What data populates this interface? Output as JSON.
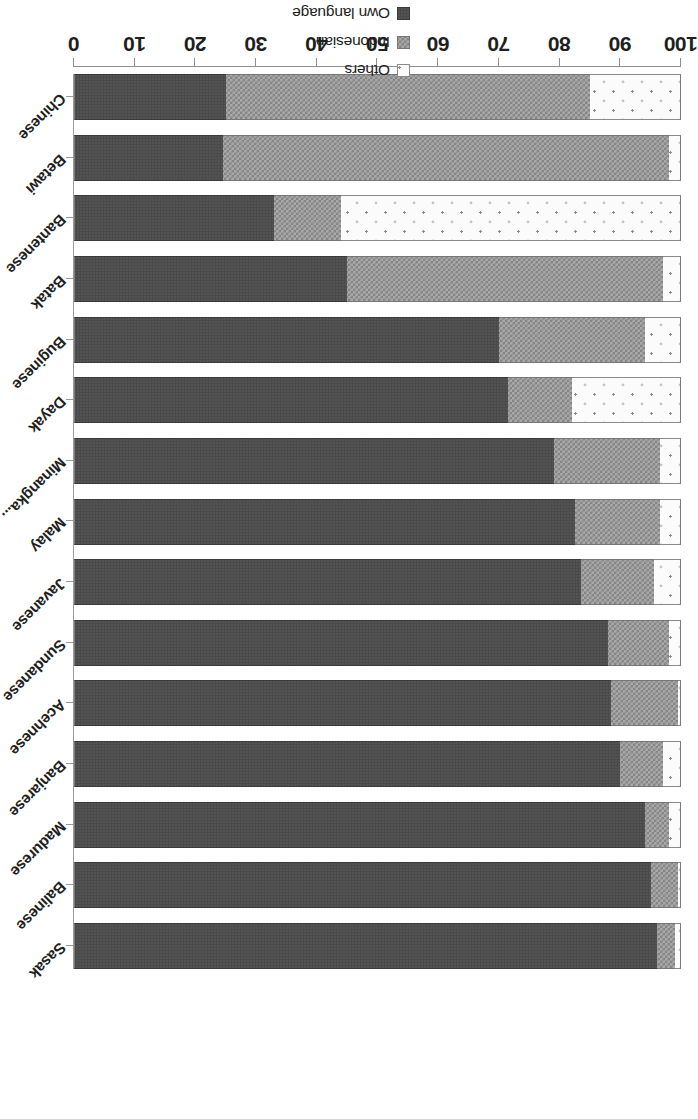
{
  "chart_data": {
    "type": "bar",
    "orientation": "horizontal",
    "stacked": true,
    "stack_mode": "percent",
    "title": "",
    "subtitle": "",
    "xlabel": "",
    "ylabel": "",
    "xlim": [
      0,
      100
    ],
    "xticks": [
      0,
      10,
      20,
      30,
      40,
      50,
      60,
      70,
      80,
      90,
      100
    ],
    "xticklabels": [
      "0",
      "10",
      "20",
      "30",
      "40",
      "50",
      "60",
      "70",
      "80",
      "90",
      "100"
    ],
    "grid": false,
    "legend_position": "bottom-center",
    "legend_order_displayed": [
      "Others",
      "Indonesian",
      "Own language"
    ],
    "categories": [
      "Sasak",
      "Balinese",
      "Madurese",
      "Banjarese",
      "Acehnese",
      "Sundanese",
      "Javanese",
      "Malay",
      "Minangka...",
      "Dayak",
      "Buginese",
      "Batak",
      "Bantenese",
      "Betawi",
      "Chinese"
    ],
    "series": [
      {
        "name": "Own language",
        "color": "#4a4a4a",
        "pattern": "solid-dark",
        "values": [
          96,
          95,
          94,
          90,
          88.5,
          88,
          83.5,
          82.5,
          79,
          71.5,
          70,
          45,
          33,
          24.5,
          25
        ]
      },
      {
        "name": "Indonesian",
        "color": "#a8a8a8",
        "pattern": "checkerboard",
        "values": [
          3,
          4.5,
          4,
          7,
          11,
          10,
          12,
          14,
          17.5,
          10.5,
          24,
          52,
          11,
          73.5,
          60
        ]
      },
      {
        "name": "Others",
        "color": "#fbfbfb",
        "pattern": "small-dots",
        "values": [
          1,
          0.5,
          2,
          3,
          0.5,
          2,
          4.5,
          3.5,
          3.5,
          18,
          6,
          3,
          56,
          2,
          15
        ]
      }
    ]
  },
  "legend": {
    "items": [
      {
        "label": "Others",
        "swatch": "others-swatch"
      },
      {
        "label": "Indonesian",
        "swatch": "indonesian-swatch"
      },
      {
        "label": "Own language",
        "swatch": "own-language-swatch"
      }
    ]
  },
  "colors": {
    "own_language": "#4a4a4a",
    "indonesian": "#a8a8a8",
    "others": "#fbfbfb",
    "axis": "#8e8e8e",
    "text": "#1f1f1f",
    "background": "#ffffff"
  }
}
